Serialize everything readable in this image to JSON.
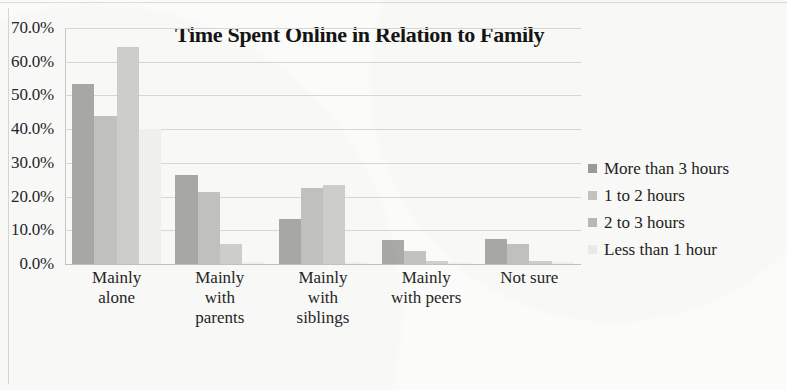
{
  "chart_data": {
    "type": "bar",
    "title": "Time Spent Online in Relation to Family",
    "xlabel": "",
    "ylabel": "",
    "ylim": [
      0,
      70
    ],
    "grid": true,
    "legend_position": "right",
    "ytick_labels": [
      "70.0%",
      "60.0%",
      "50.0%",
      "40.0%",
      "30.0%",
      "20.0%",
      "10.0%",
      "0.0%"
    ],
    "ytick_values": [
      70,
      60,
      50,
      40,
      30,
      20,
      10,
      0
    ],
    "categories": [
      "Mainly alone",
      "Mainly with parents",
      "Mainly with siblings",
      "Mainly with peers",
      "Not sure"
    ],
    "category_lines": [
      [
        "Mainly",
        "alone"
      ],
      [
        "Mainly",
        "with",
        "parents"
      ],
      [
        "Mainly",
        "with",
        "siblings"
      ],
      [
        "Mainly",
        "with peers"
      ],
      [
        "Not sure"
      ]
    ],
    "series": [
      {
        "name": "More than 3 hours",
        "color": "#a9a9a6",
        "values": [
          53.5,
          26.5,
          13.5,
          7.0,
          7.5
        ]
      },
      {
        "name": "1 to 2 hours",
        "color": "#c2c2bf",
        "values": [
          44.0,
          21.5,
          22.5,
          4.0,
          6.0
        ]
      },
      {
        "name": "2 to 3 hours",
        "color": "#cfcfcc",
        "values": [
          64.5,
          6.0,
          23.5,
          0.8,
          0.8
        ]
      },
      {
        "name": "Less than 1 hour",
        "color": "#f2f2ef",
        "values": [
          40.0,
          0.5,
          0.5,
          0.5,
          0.5
        ]
      }
    ]
  }
}
